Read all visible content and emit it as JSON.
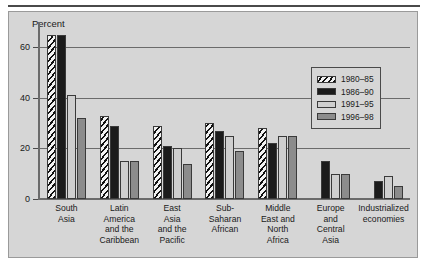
{
  "chart_data": {
    "type": "bar",
    "title": "",
    "xlabel": "",
    "ylabel": "Percent",
    "ylim": [
      0,
      70
    ],
    "yticks": [
      0,
      20,
      40,
      60
    ],
    "ytick_labels": [
      "0",
      "20",
      "40",
      "60"
    ],
    "grid": "horizontal",
    "legend_position": "top-right",
    "categories": [
      "South Asia",
      "Latin America and the Caribbean",
      "East Asia and the Pacific",
      "Sub-Saharan African",
      "Middle East and North Africa",
      "Europe and Central Asia",
      "Industrialized economies"
    ],
    "category_label_lines": [
      [
        "South",
        "Asia"
      ],
      [
        "Latin",
        "America",
        "and the",
        "Caribbean"
      ],
      [
        "East",
        "Asia",
        "and the",
        "Pacific"
      ],
      [
        "Sub-",
        "Saharan",
        "African"
      ],
      [
        "Middle",
        "East and",
        "North",
        "Africa"
      ],
      [
        "Europe",
        "and",
        "Central",
        "Asia"
      ],
      [
        "Industrialized",
        "economies"
      ]
    ],
    "series": [
      {
        "name": "1980–85",
        "pattern": "diagonal-hatch",
        "color": "#f2f2f2",
        "values": [
          65,
          33,
          29,
          30,
          28,
          null,
          null
        ]
      },
      {
        "name": "1986–90",
        "pattern": "solid",
        "color": "#1b1b1b",
        "values": [
          65,
          29,
          21,
          27,
          22,
          15,
          7
        ]
      },
      {
        "name": "1991–95",
        "pattern": "solid",
        "color": "#cfcfcf",
        "values": [
          41,
          15,
          20,
          25,
          25,
          10,
          9
        ]
      },
      {
        "name": "1996–98",
        "pattern": "solid",
        "color": "#8c8c8c",
        "values": [
          32,
          15,
          14,
          19,
          25,
          10,
          5
        ]
      }
    ]
  },
  "legend": {
    "entries": [
      {
        "label": "1980–85"
      },
      {
        "label": "1986–90"
      },
      {
        "label": "1991–95"
      },
      {
        "label": "1996–98"
      }
    ]
  },
  "axis": {
    "y_title": "Percent"
  },
  "colors": {
    "panel_background": "#d6d6d6",
    "panel_border": "#9a9a9a",
    "top_rule": "#4a4a4a",
    "axis": "#6b6b6b",
    "text": "#1a1a1a"
  }
}
